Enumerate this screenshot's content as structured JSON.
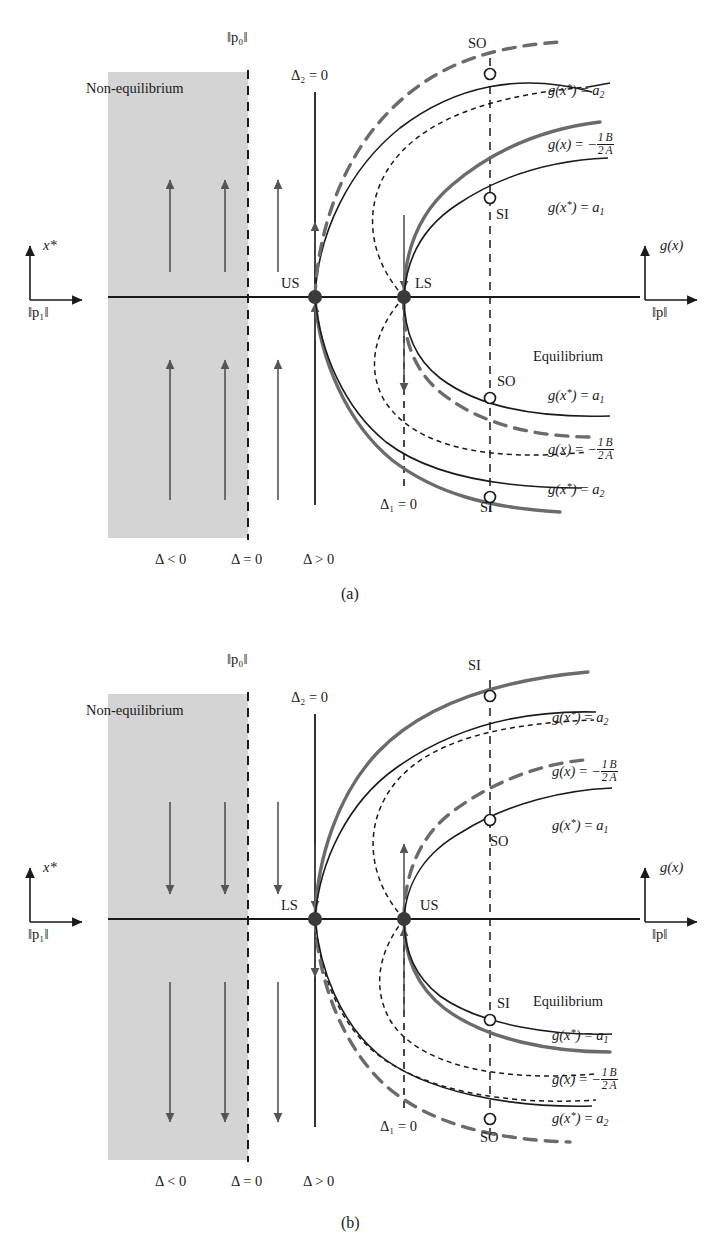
{
  "figure": {
    "type": "bifurcation-diagram",
    "panels": [
      {
        "id": "a",
        "caption": "(a)",
        "region_label": "Non-equilibrium",
        "equilibrium_label": "Equilibrium",
        "left_axis": {
          "vertical_label": "x*",
          "horizontal_label": "‖p₁‖"
        },
        "right_axis": {
          "vertical_label": "g(x)",
          "horizontal_label": "‖p‖"
        },
        "p0_label": "‖p₀‖",
        "delta2_label": "Δ₂ = 0",
        "delta1_label": "Δ₁ = 0",
        "delta_signs": [
          "Δ < 0",
          "Δ = 0",
          "Δ > 0"
        ],
        "fixed_points": [
          {
            "name": "US",
            "x": 315,
            "y": 297
          },
          {
            "name": "LS",
            "x": 404,
            "y": 297
          }
        ],
        "arrow_direction": "up",
        "markers": [
          {
            "name": "SO",
            "x": 490,
            "y": 74,
            "label_pos": "above-left"
          },
          {
            "name": "SI",
            "x": 490,
            "y": 198,
            "label_pos": "below-right"
          },
          {
            "name": "SO",
            "x": 490,
            "y": 398,
            "label_pos": "above-right"
          },
          {
            "name": "SI",
            "x": 490,
            "y": 497,
            "label_pos": "below-right"
          }
        ],
        "curve_labels_upper": [
          "g(x*) = a₂",
          "g(x) = -1/2 B/A",
          "g(x*) = a₁"
        ],
        "curve_labels_lower": [
          "g(x*) = a₁",
          "g(x) = -1/2 B/A",
          "g(x*) = a₂"
        ]
      },
      {
        "id": "b",
        "caption": "(b)",
        "region_label": "Non-equilibrium",
        "equilibrium_label": "Equilibrium",
        "left_axis": {
          "vertical_label": "x*",
          "horizontal_label": "‖p₁‖"
        },
        "right_axis": {
          "vertical_label": "g(x)",
          "horizontal_label": "‖p‖"
        },
        "p0_label": "‖p₀‖",
        "delta2_label": "Δ₂ = 0",
        "delta1_label": "Δ₁ = 0",
        "delta_signs": [
          "Δ < 0",
          "Δ = 0",
          "Δ > 0"
        ],
        "fixed_points": [
          {
            "name": "LS",
            "x": 315,
            "y": 297
          },
          {
            "name": "US",
            "x": 404,
            "y": 297
          }
        ],
        "arrow_direction": "down",
        "markers": [
          {
            "name": "SI",
            "x": 490,
            "y": 74,
            "label_pos": "above-left"
          },
          {
            "name": "SO",
            "x": 490,
            "y": 198,
            "label_pos": "below-right"
          },
          {
            "name": "SI",
            "x": 490,
            "y": 398,
            "label_pos": "above-right"
          },
          {
            "name": "SO",
            "x": 490,
            "y": 497,
            "label_pos": "below-right"
          }
        ],
        "curve_labels_upper": [
          "g(x*) = a₂",
          "g(x) = -1/2 B/A",
          "g(x*) = a₁"
        ],
        "curve_labels_lower": [
          "g(x*) = a₁",
          "g(x) = -1/2 B/A",
          "g(x*) = a₂"
        ]
      }
    ],
    "text": {
      "non_equilibrium": "Non-equilibrium",
      "equilibrium": "Equilibrium",
      "us": "US",
      "ls": "LS",
      "si": "SI",
      "so": "SO",
      "p0": "‖p₀‖",
      "p1": "‖p₁‖",
      "p": "‖p‖",
      "xstar": "x*",
      "gx": "g(x)",
      "delta2_eq0": "Δ₂ = 0",
      "delta1_eq0": "Δ₁ = 0",
      "delta_lt0": "Δ < 0",
      "delta_eq0": "Δ = 0",
      "delta_gt0": "Δ > 0",
      "caption_a": "(a)",
      "caption_b": "(b)"
    },
    "colors": {
      "shade": "#d4d4d4",
      "ink": "#1a1a1a",
      "grey_curve": "#6b6b6b",
      "axis": "#1a1a1a"
    }
  }
}
